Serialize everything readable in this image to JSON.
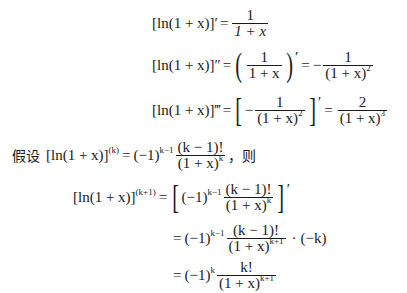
{
  "document": {
    "lines": [
      {
        "id": "first-derivative",
        "lhs": "[ln(1 + x)]′",
        "eq": "=",
        "rhs_fraction": {
          "num": "1",
          "den": "1 + x"
        }
      },
      {
        "id": "second-derivative",
        "lhs": "[ln(1 + x)]″",
        "eq1": "=",
        "inner_fraction": {
          "num": "1",
          "den": "1 + x"
        },
        "prime": "′",
        "eq2": "=",
        "sign": "−",
        "rhs_fraction": {
          "num": "1",
          "den": "(1 + x)",
          "den_exp": "2"
        }
      },
      {
        "id": "third-derivative",
        "lhs": "[ln(1 + x)]‴",
        "eq1": "=",
        "sign": "−",
        "inner_fraction": {
          "num": "1",
          "den": "(1 + x)",
          "den_exp": "2"
        },
        "prime": "′",
        "eq2": "=",
        "rhs_fraction": {
          "num": "2",
          "den": "(1 + x)",
          "den_exp": "3"
        }
      },
      {
        "id": "assumption",
        "prefix": "假设",
        "lhs": "[ln(1 + x)]",
        "lhs_exp": "(k)",
        "eq": "=",
        "coef": "(−1)",
        "coef_exp": "k−1",
        "fraction": {
          "num": "(k − 1)!",
          "den": "(1 + x)",
          "den_exp": "k"
        },
        "suffix": "，则"
      },
      {
        "id": "induction-step-1",
        "lhs": "[ln(1 + x)]",
        "lhs_exp": "(k+1)",
        "eq": "=",
        "coef": "(−1)",
        "coef_exp": "k−1",
        "fraction": {
          "num": "(k − 1)!",
          "den": "(1 + x)",
          "den_exp": "k"
        },
        "prime": "′"
      },
      {
        "id": "induction-step-2",
        "eq": "=",
        "coef": "(−1)",
        "coef_exp": "k−1",
        "fraction": {
          "num": "(k − 1)!",
          "den": "(1 + x)",
          "den_exp": "k+1"
        },
        "dot": "·",
        "factor": "(−k)"
      },
      {
        "id": "induction-step-3",
        "eq": "=",
        "coef": "(−1)",
        "coef_exp": "k",
        "fraction": {
          "num": "k!",
          "den": "(1 + x)",
          "den_exp": "k+1"
        }
      }
    ]
  }
}
